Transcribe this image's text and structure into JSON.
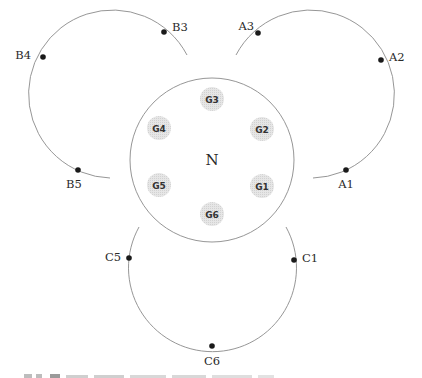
{
  "diagram": {
    "center_node": {
      "label": "N",
      "cx": 212,
      "cy": 160,
      "r": 82
    },
    "groups": [
      {
        "label": "G1",
        "cx": 262,
        "cy": 186
      },
      {
        "label": "G2",
        "cx": 262,
        "cy": 129
      },
      {
        "label": "G3",
        "cx": 212,
        "cy": 99
      },
      {
        "label": "G4",
        "cx": 159,
        "cy": 128
      },
      {
        "label": "G5",
        "cx": 159,
        "cy": 185
      },
      {
        "label": "G6",
        "cx": 212,
        "cy": 214
      }
    ],
    "arcs": [
      {
        "name": "A",
        "path": "M 236 55 A 84 84 0 1 1 313 178",
        "nodes": [
          {
            "label": "A1",
            "x": 346,
            "y": 170,
            "lx": 346,
            "ly": 188,
            "anchor": "middle"
          },
          {
            "label": "A2",
            "x": 381,
            "y": 60,
            "lx": 389,
            "ly": 61,
            "anchor": "start"
          },
          {
            "label": "A3",
            "x": 258,
            "y": 33,
            "lx": 254,
            "ly": 30,
            "anchor": "end"
          }
        ]
      },
      {
        "name": "B",
        "path": "M 187 55 A 84 84 0 1 0 110 178",
        "nodes": [
          {
            "label": "B3",
            "x": 164,
            "y": 32,
            "lx": 172,
            "ly": 31,
            "anchor": "start"
          },
          {
            "label": "B4",
            "x": 43,
            "y": 57,
            "lx": 31,
            "ly": 59,
            "anchor": "end"
          },
          {
            "label": "B5",
            "x": 78,
            "y": 170,
            "lx": 74,
            "ly": 188,
            "anchor": "middle"
          }
        ]
      },
      {
        "name": "C",
        "path": "M 139 227 A 84 84 0 1 0 286 227",
        "nodes": [
          {
            "label": "C1",
            "x": 294,
            "y": 260,
            "lx": 302,
            "ly": 262,
            "anchor": "start"
          },
          {
            "label": "C5",
            "x": 129,
            "y": 258,
            "lx": 121,
            "ly": 261,
            "anchor": "end"
          },
          {
            "label": "C6",
            "x": 212,
            "y": 346,
            "lx": 212,
            "ly": 365,
            "anchor": "middle"
          }
        ]
      }
    ],
    "caption_partial": "(caption text cut off at bottom edge — not legible)"
  }
}
